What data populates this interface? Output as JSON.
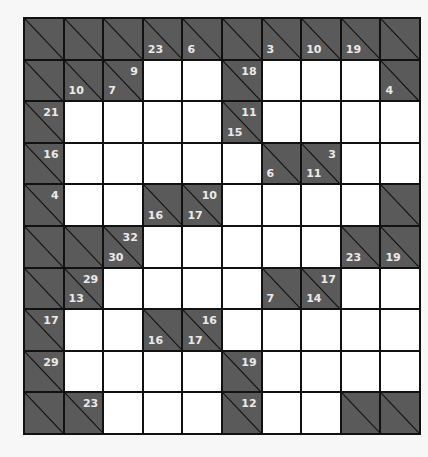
{
  "puzzle": {
    "type": "kakuro",
    "rows": 10,
    "cols": 10,
    "colors": {
      "clue_bg": "#5a5a5a",
      "clue_text": "#eaeaea",
      "grid_line": "#111111",
      "white_cell": "#ffffff"
    },
    "grid": [
      [
        {
          "t": "c",
          "d": "",
          "a": ""
        },
        {
          "t": "c",
          "d": "",
          "a": ""
        },
        {
          "t": "c",
          "d": "",
          "a": ""
        },
        {
          "t": "c",
          "d": "23",
          "a": ""
        },
        {
          "t": "c",
          "d": "6",
          "a": ""
        },
        {
          "t": "c",
          "d": "",
          "a": ""
        },
        {
          "t": "c",
          "d": "3",
          "a": ""
        },
        {
          "t": "c",
          "d": "10",
          "a": ""
        },
        {
          "t": "c",
          "d": "19",
          "a": ""
        },
        {
          "t": "c",
          "d": "",
          "a": ""
        }
      ],
      [
        {
          "t": "c",
          "d": "",
          "a": ""
        },
        {
          "t": "c",
          "d": "10",
          "a": ""
        },
        {
          "t": "c",
          "d": "7",
          "a": "9"
        },
        {
          "t": "w",
          "v": ""
        },
        {
          "t": "w",
          "v": ""
        },
        {
          "t": "c",
          "d": "",
          "a": "18"
        },
        {
          "t": "w",
          "v": ""
        },
        {
          "t": "w",
          "v": ""
        },
        {
          "t": "w",
          "v": ""
        },
        {
          "t": "c",
          "d": "4",
          "a": ""
        }
      ],
      [
        {
          "t": "c",
          "d": "",
          "a": "21"
        },
        {
          "t": "w",
          "v": ""
        },
        {
          "t": "w",
          "v": ""
        },
        {
          "t": "w",
          "v": ""
        },
        {
          "t": "w",
          "v": ""
        },
        {
          "t": "c",
          "d": "15",
          "a": "11"
        },
        {
          "t": "w",
          "v": ""
        },
        {
          "t": "w",
          "v": ""
        },
        {
          "t": "w",
          "v": ""
        },
        {
          "t": "w",
          "v": ""
        }
      ],
      [
        {
          "t": "c",
          "d": "",
          "a": "16"
        },
        {
          "t": "w",
          "v": ""
        },
        {
          "t": "w",
          "v": ""
        },
        {
          "t": "w",
          "v": ""
        },
        {
          "t": "w",
          "v": ""
        },
        {
          "t": "w",
          "v": ""
        },
        {
          "t": "c",
          "d": "6",
          "a": ""
        },
        {
          "t": "c",
          "d": "11",
          "a": "3"
        },
        {
          "t": "w",
          "v": ""
        },
        {
          "t": "w",
          "v": ""
        }
      ],
      [
        {
          "t": "c",
          "d": "",
          "a": "4"
        },
        {
          "t": "w",
          "v": ""
        },
        {
          "t": "w",
          "v": ""
        },
        {
          "t": "c",
          "d": "16",
          "a": ""
        },
        {
          "t": "c",
          "d": "17",
          "a": "10"
        },
        {
          "t": "w",
          "v": ""
        },
        {
          "t": "w",
          "v": ""
        },
        {
          "t": "w",
          "v": ""
        },
        {
          "t": "w",
          "v": ""
        },
        {
          "t": "c",
          "d": "",
          "a": ""
        }
      ],
      [
        {
          "t": "c",
          "d": "",
          "a": ""
        },
        {
          "t": "c",
          "d": "",
          "a": ""
        },
        {
          "t": "c",
          "d": "30",
          "a": "32"
        },
        {
          "t": "w",
          "v": ""
        },
        {
          "t": "w",
          "v": ""
        },
        {
          "t": "w",
          "v": ""
        },
        {
          "t": "w",
          "v": ""
        },
        {
          "t": "w",
          "v": ""
        },
        {
          "t": "c",
          "d": "23",
          "a": ""
        },
        {
          "t": "c",
          "d": "19",
          "a": ""
        }
      ],
      [
        {
          "t": "c",
          "d": "",
          "a": ""
        },
        {
          "t": "c",
          "d": "13",
          "a": "29"
        },
        {
          "t": "w",
          "v": ""
        },
        {
          "t": "w",
          "v": ""
        },
        {
          "t": "w",
          "v": ""
        },
        {
          "t": "w",
          "v": ""
        },
        {
          "t": "c",
          "d": "7",
          "a": ""
        },
        {
          "t": "c",
          "d": "14",
          "a": "17"
        },
        {
          "t": "w",
          "v": ""
        },
        {
          "t": "w",
          "v": ""
        }
      ],
      [
        {
          "t": "c",
          "d": "",
          "a": "17"
        },
        {
          "t": "w",
          "v": ""
        },
        {
          "t": "w",
          "v": ""
        },
        {
          "t": "c",
          "d": "16",
          "a": ""
        },
        {
          "t": "c",
          "d": "17",
          "a": "16"
        },
        {
          "t": "w",
          "v": ""
        },
        {
          "t": "w",
          "v": ""
        },
        {
          "t": "w",
          "v": ""
        },
        {
          "t": "w",
          "v": ""
        },
        {
          "t": "w",
          "v": ""
        }
      ],
      [
        {
          "t": "c",
          "d": "",
          "a": "29"
        },
        {
          "t": "w",
          "v": ""
        },
        {
          "t": "w",
          "v": ""
        },
        {
          "t": "w",
          "v": ""
        },
        {
          "t": "w",
          "v": ""
        },
        {
          "t": "c",
          "d": "",
          "a": "19"
        },
        {
          "t": "w",
          "v": ""
        },
        {
          "t": "w",
          "v": ""
        },
        {
          "t": "w",
          "v": ""
        },
        {
          "t": "w",
          "v": ""
        }
      ],
      [
        {
          "t": "c",
          "d": "",
          "a": ""
        },
        {
          "t": "c",
          "d": "",
          "a": "23"
        },
        {
          "t": "w",
          "v": ""
        },
        {
          "t": "w",
          "v": ""
        },
        {
          "t": "w",
          "v": ""
        },
        {
          "t": "c",
          "d": "",
          "a": "12"
        },
        {
          "t": "w",
          "v": ""
        },
        {
          "t": "w",
          "v": ""
        },
        {
          "t": "c",
          "d": "",
          "a": ""
        },
        {
          "t": "c",
          "d": "",
          "a": ""
        }
      ]
    ]
  }
}
